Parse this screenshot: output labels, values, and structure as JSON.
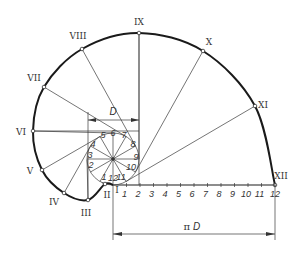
{
  "circle_division_labels": [
    "1",
    "2",
    "3",
    "4",
    "5",
    "6",
    "7",
    "8",
    "9",
    "10",
    "11",
    "12"
  ],
  "baseline_tick_labels": [
    "1",
    "2",
    "3",
    "4",
    "5",
    "6",
    "7",
    "8",
    "9",
    "10",
    "11",
    "12"
  ],
  "involute_point_labels": [
    "I",
    "II",
    "III",
    "IV",
    "V",
    "VI",
    "VII",
    "VIII",
    "IX",
    "X",
    "XI",
    "XII"
  ],
  "dimensions": {
    "diameter_label": "D",
    "length_label_pi": "π",
    "length_label_d": "D"
  },
  "divisions": 12
}
